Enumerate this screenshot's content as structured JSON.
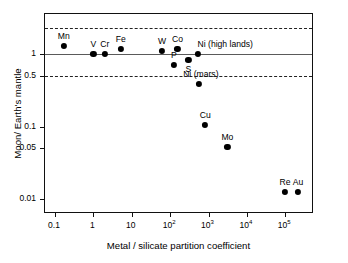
{
  "chart_data": {
    "type": "scatter",
    "title": "",
    "xlabel": "Metal / silicate partition coefficient",
    "ylabel": "Moon/ Earth's mantle",
    "xscale": "log",
    "yscale": "log",
    "xlim": [
      0.055,
      560000
    ],
    "ylim": [
      0.0062,
      3.6
    ],
    "grid": false,
    "legend": "none",
    "xticks": [
      {
        "value": 0.1,
        "label": "0.1"
      },
      {
        "value": 1,
        "label": "1"
      },
      {
        "value": 10,
        "label": "10"
      },
      {
        "value": 100,
        "label": "10",
        "exp": "2"
      },
      {
        "value": 1000,
        "label": "10",
        "exp": "3"
      },
      {
        "value": 10000,
        "label": "10",
        "exp": "4"
      },
      {
        "value": 100000,
        "label": "10",
        "exp": "5"
      }
    ],
    "yticks": [
      {
        "value": 1,
        "label": "1"
      },
      {
        "value": 0.5,
        "label": "0.5"
      },
      {
        "value": 0.1,
        "label": "0.1"
      },
      {
        "value": 0.05,
        "label": "0.05"
      },
      {
        "value": 0.01,
        "label": "0.01"
      }
    ],
    "reference_lines": [
      {
        "value": 2.33,
        "style": "dashed",
        "name": "upper-bound-line"
      },
      {
        "value": 1.0,
        "style": "solid",
        "name": "unity-line"
      },
      {
        "value": 0.5,
        "style": "dashed",
        "name": "lower-bound-line"
      }
    ],
    "points": [
      {
        "label": "Mn",
        "x": 0.17,
        "y": 1.32,
        "label_dx": 0,
        "label_dy": -5
      },
      {
        "label": "V",
        "x": 1.0,
        "y": 1.0,
        "label_dx": 0,
        "label_dy": -5
      },
      {
        "label": "Cr",
        "x": 2.0,
        "y": 1.0,
        "label_dx": 0,
        "label_dy": -5
      },
      {
        "label": "Fe",
        "x": 5.2,
        "y": 1.2,
        "label_dx": 0,
        "label_dy": -5
      },
      {
        "label": "W",
        "x": 62,
        "y": 1.12,
        "label_dx": 0,
        "label_dy": -5
      },
      {
        "label": "Co",
        "x": 155,
        "y": 1.2,
        "label_dx": 0,
        "label_dy": -5
      },
      {
        "label": "Ni (high lands)",
        "x": 540,
        "y": 1.0,
        "label_dx": 27,
        "label_dy": -5
      },
      {
        "label": "P",
        "x": 125,
        "y": 0.72,
        "label_dx": 0,
        "label_dy": -5
      },
      {
        "label": "S",
        "x": 300,
        "y": 0.84,
        "label_dx": 0,
        "label_dy": 14
      },
      {
        "label": "Ni (mars)",
        "x": 560,
        "y": 0.39,
        "label_dx": 2,
        "label_dy": -5
      },
      {
        "label": "Cu",
        "x": 820,
        "y": 0.105,
        "label_dx": 0,
        "label_dy": -5
      },
      {
        "label": "Mo",
        "x": 3100,
        "y": 0.052,
        "label_dx": 0,
        "label_dy": -5
      },
      {
        "label": "Re",
        "x": 98000,
        "y": 0.0125,
        "label_dx": 0,
        "label_dy": -5
      },
      {
        "label": "Au",
        "x": 215000,
        "y": 0.0125,
        "label_dx": 0,
        "label_dy": -5
      }
    ]
  }
}
